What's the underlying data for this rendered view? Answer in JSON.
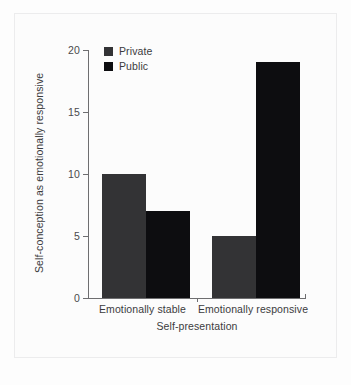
{
  "chart_data": {
    "type": "bar",
    "title": "",
    "categories": [
      "Emotionally stable",
      "Emotionally responsive"
    ],
    "series": [
      {
        "name": "Private",
        "values": [
          10,
          5
        ],
        "color": "#333335"
      },
      {
        "name": "Public",
        "values": [
          7,
          19
        ],
        "color": "#0d0d10"
      }
    ],
    "xlabel": "Self-presentation",
    "ylabel": "Self-conception as emotionally responsive",
    "ylim": [
      0,
      20
    ],
    "yticks": [
      0,
      5,
      10,
      15,
      20
    ],
    "ytick_labels": [
      "0",
      "5",
      "10",
      "15",
      "20"
    ],
    "grid": false,
    "legend_position": "top-left"
  },
  "legend": {
    "items": [
      {
        "label": "Private",
        "color": "#333335"
      },
      {
        "label": "Public",
        "color": "#0d0d10"
      }
    ]
  },
  "axes": {
    "y_title": "Self-conception as emotionally responsive",
    "x_title": "Self-presentation",
    "y_ticks": [
      "20",
      "15",
      "10",
      "5",
      "0"
    ],
    "x_categories": [
      "Emotionally stable",
      "Emotionally responsive"
    ]
  },
  "colors": {
    "background": "#fcfcfc",
    "axis": "#6e6e70",
    "text": "#3b3b3d",
    "private": "#333335",
    "public": "#0d0d10"
  }
}
